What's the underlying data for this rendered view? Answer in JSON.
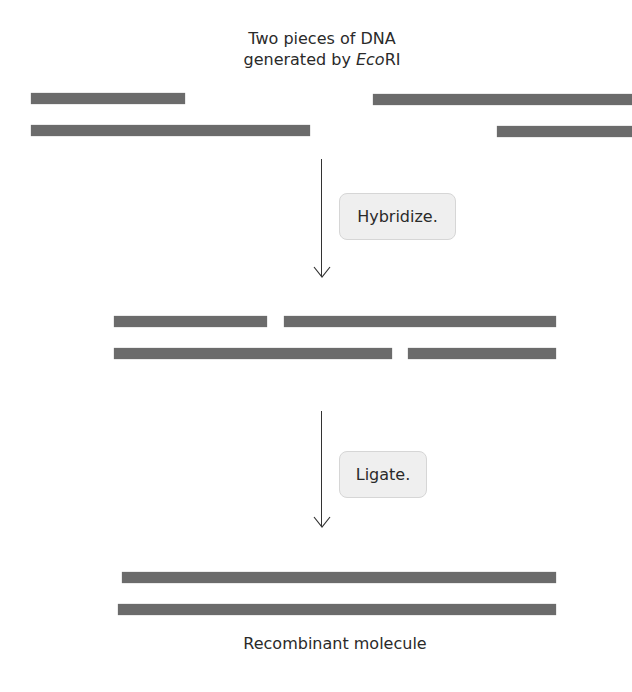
{
  "title": {
    "line1": "Two pieces of DNA",
    "line2_prefix": "generated by ",
    "line2_italic": "Eco",
    "line2_suffix": "RI"
  },
  "steps": [
    {
      "label": "Hybridize."
    },
    {
      "label": "Ligate."
    }
  ],
  "caption": "Recombinant molecule",
  "colors": {
    "strand": "#6b6b6b",
    "box_fill": "#efefef",
    "arrow": "#333333"
  },
  "stages": [
    {
      "name": "separate-fragments",
      "strands": [
        {
          "x": 31,
          "y": 93,
          "w": 154
        },
        {
          "x": 373,
          "y": 94,
          "w": 259
        },
        {
          "x": 31,
          "y": 125,
          "w": 279
        },
        {
          "x": 497,
          "y": 126,
          "w": 135
        }
      ]
    },
    {
      "name": "hybridized-fragments",
      "strands": [
        {
          "x": 114,
          "y": 316,
          "w": 153
        },
        {
          "x": 284,
          "y": 316,
          "w": 272
        },
        {
          "x": 114,
          "y": 348,
          "w": 278
        },
        {
          "x": 408,
          "y": 348,
          "w": 148
        }
      ]
    },
    {
      "name": "recombinant-molecule",
      "strands": [
        {
          "x": 122,
          "y": 572,
          "w": 434
        },
        {
          "x": 118,
          "y": 604,
          "w": 438
        }
      ]
    }
  ]
}
